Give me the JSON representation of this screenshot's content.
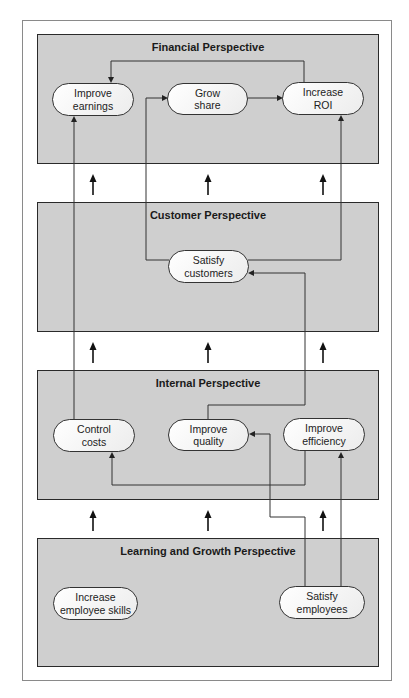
{
  "diagram": {
    "type": "balanced-scorecard-strategy-map",
    "colors": {
      "panel_fill": "#cfcfcf",
      "panel_border": "#2a2a2a",
      "pill_fill": "#f4f4f4",
      "line": "#333333",
      "background": "#ffffff"
    },
    "perspectives": [
      {
        "id": "financial",
        "title": "Financial Perspective",
        "objectives": [
          {
            "id": "improve_earnings",
            "line1": "Improve",
            "line2": "earnings"
          },
          {
            "id": "grow_share",
            "line1": "Grow",
            "line2": "share"
          },
          {
            "id": "increase_roi",
            "line1": "Increase",
            "line2": "ROI"
          }
        ]
      },
      {
        "id": "customer",
        "title": "Customer Perspective",
        "objectives": [
          {
            "id": "satisfy_customers",
            "line1": "Satisfy",
            "line2": "customers"
          }
        ]
      },
      {
        "id": "internal",
        "title": "Internal Perspective",
        "objectives": [
          {
            "id": "control_costs",
            "line1": "Control",
            "line2": "costs"
          },
          {
            "id": "improve_quality",
            "line1": "Improve",
            "line2": "quality"
          },
          {
            "id": "improve_efficiency",
            "line1": "Improve",
            "line2": "efficiency"
          }
        ]
      },
      {
        "id": "learning",
        "title": "Learning and Growth Perspective",
        "objectives": [
          {
            "id": "increase_employee_skills",
            "line1": "Increase",
            "line2": "employee skills"
          },
          {
            "id": "satisfy_employees",
            "line1": "Satisfy",
            "line2": "employees"
          }
        ]
      }
    ],
    "links": [
      {
        "from": "increase_roi",
        "to": "improve_earnings"
      },
      {
        "from": "grow_share",
        "to": "increase_roi"
      },
      {
        "from": "satisfy_customers",
        "to": "grow_share"
      },
      {
        "from": "satisfy_customers",
        "to": "increase_roi"
      },
      {
        "from": "control_costs",
        "to": "improve_earnings"
      },
      {
        "from": "improve_quality",
        "to": "satisfy_customers"
      },
      {
        "from": "improve_efficiency",
        "to": "control_costs"
      },
      {
        "from": "satisfy_employees",
        "to": "improve_quality"
      },
      {
        "from": "satisfy_employees",
        "to": "improve_efficiency"
      }
    ],
    "between_panel_arrows": "3 upward arrows between each pair of adjacent perspectives"
  }
}
